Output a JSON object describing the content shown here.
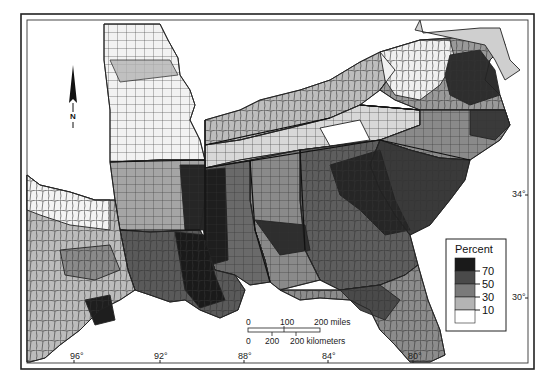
{
  "map": {
    "subject": "Percent by county, southeastern United States",
    "legend": {
      "title": "Percent",
      "classes": [
        {
          "label": "",
          "range": ">70",
          "color": "#1a1a1a"
        },
        {
          "label": "70",
          "range": "50-70",
          "color": "#4a4a4a"
        },
        {
          "label": "50",
          "range": "30-50",
          "color": "#7a7a7a"
        },
        {
          "label": "30",
          "range": "10-30",
          "color": "#b4b4b4"
        },
        {
          "label": "10",
          "range": "<10",
          "color": "#ffffff"
        }
      ],
      "tick_labels": [
        "70",
        "50",
        "30",
        "10"
      ]
    },
    "scale_bar": {
      "miles_labels": [
        "0",
        "100",
        "200 miles"
      ],
      "km_labels": [
        "0",
        "200",
        "200 kilometers"
      ]
    },
    "longitude_labels": [
      "96°",
      "92°",
      "88°",
      "84°",
      "80°"
    ],
    "latitude_labels": [
      "34°",
      "30°"
    ],
    "north_arrow": {
      "label": "N"
    },
    "colors": {
      "very_dark": "#1a1a1a",
      "dark": "#4a4a4a",
      "mid": "#7a7a7a",
      "light": "#b4b4b4",
      "white": "#ffffff",
      "border": "#222222"
    }
  }
}
